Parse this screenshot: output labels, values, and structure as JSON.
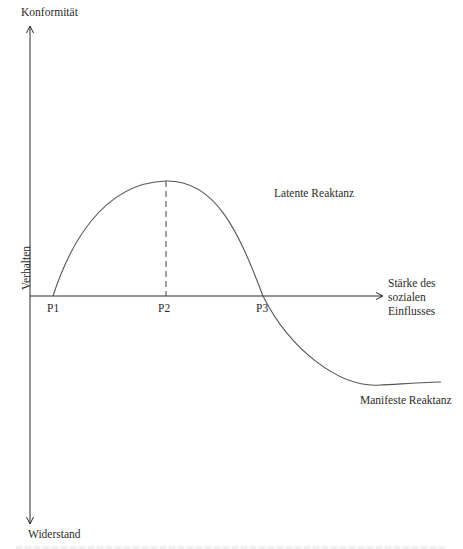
{
  "diagram": {
    "type": "reactance-curve",
    "y_axis": {
      "label": "Verhalten",
      "top_label": "Konformität",
      "bottom_label": "Widerstand"
    },
    "x_axis": {
      "label_lines": [
        "Stärke des",
        "sozialen",
        "Einflusses"
      ],
      "label": "Stärke des sozialen Einflusses"
    },
    "points": [
      {
        "id": "P1",
        "label": "P1"
      },
      {
        "id": "P2",
        "label": "P2"
      },
      {
        "id": "P3",
        "label": "P3"
      }
    ],
    "regions": {
      "latent": "Latente Reaktanz",
      "manifest": "Manifeste Reaktanz"
    },
    "colors": {
      "axis": "#2a2a2a",
      "curve": "#555555",
      "dashed": "#444444",
      "text": "#2b2b2b",
      "background": "#ffffff"
    }
  }
}
